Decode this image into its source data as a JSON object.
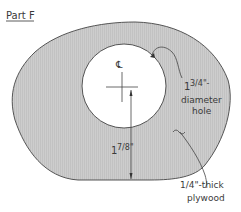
{
  "title": "Part F",
  "labels": {
    "centerline": "℄",
    "hole_diameter_whole": "1",
    "hole_diameter_frac": "3/4\"-",
    "hole_line2": "diameter",
    "hole_line3": "hole",
    "dim_whole": "1",
    "dim_frac": "7/8\"",
    "material_frac": "1/4\"-thick",
    "material_line2": "plywood"
  },
  "colors": {
    "fill": "#c9c9c9",
    "outline": "#555555",
    "text": "#3a3a3a"
  }
}
